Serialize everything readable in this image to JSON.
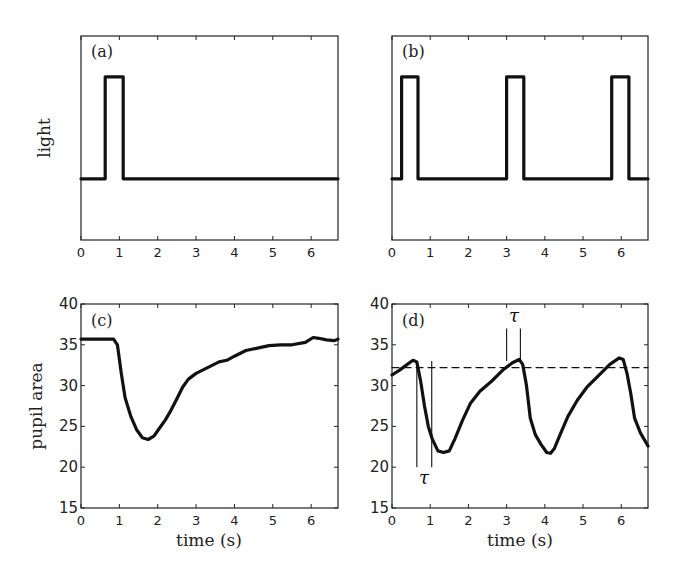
{
  "chart_data": [
    {
      "panel": "(a)",
      "type": "line",
      "title": "",
      "xlabel": "",
      "ylabel": "light",
      "xlim": [
        0,
        6.7
      ],
      "ylim": [
        -0.6,
        1.4
      ],
      "xticks": [
        "0",
        "1",
        "2",
        "3",
        "4",
        "5",
        "6"
      ],
      "yticks": [],
      "grid": false,
      "series": [
        {
          "name": "light stimulus",
          "x": [
            0,
            0.63,
            0.63,
            1.1,
            1.1,
            6.7
          ],
          "y": [
            0,
            0,
            1,
            1,
            0,
            0
          ]
        }
      ]
    },
    {
      "panel": "(b)",
      "type": "line",
      "title": "",
      "xlabel": "",
      "ylabel": "",
      "xlim": [
        0,
        6.7
      ],
      "ylim": [
        -0.6,
        1.4
      ],
      "xticks": [
        "0",
        "1",
        "2",
        "3",
        "4",
        "5",
        "6"
      ],
      "yticks": [],
      "grid": false,
      "series": [
        {
          "name": "light stimulus",
          "x": [
            0,
            0.25,
            0.25,
            0.68,
            0.68,
            3.0,
            3.0,
            3.45,
            3.45,
            5.75,
            5.75,
            6.2,
            6.2,
            6.7
          ],
          "y": [
            0,
            0,
            1,
            1,
            0,
            0,
            1,
            1,
            0,
            0,
            1,
            1,
            0,
            0
          ]
        }
      ]
    },
    {
      "panel": "(c)",
      "type": "line",
      "title": "",
      "xlabel": "time (s)",
      "ylabel": "pupil area",
      "xlim": [
        0,
        6.7
      ],
      "ylim": [
        15,
        40
      ],
      "xticks": [
        "0",
        "1",
        "2",
        "3",
        "4",
        "5",
        "6"
      ],
      "yticks": [
        "15",
        "20",
        "25",
        "30",
        "35",
        "40"
      ],
      "grid": false,
      "series": [
        {
          "name": "pupil area",
          "x": [
            0,
            0.85,
            0.95,
            1.05,
            1.15,
            1.3,
            1.45,
            1.6,
            1.75,
            1.9,
            2.05,
            2.2,
            2.35,
            2.5,
            2.65,
            2.8,
            3.0,
            3.3,
            3.6,
            3.8,
            4.0,
            4.3,
            4.6,
            4.9,
            5.2,
            5.5,
            5.85,
            6.05,
            6.2,
            6.4,
            6.6,
            6.7
          ],
          "y": [
            35.7,
            35.7,
            35.0,
            31.5,
            28.5,
            26.2,
            24.6,
            23.6,
            23.4,
            23.8,
            24.8,
            25.8,
            27.0,
            28.4,
            29.8,
            30.8,
            31.5,
            32.2,
            32.9,
            33.1,
            33.6,
            34.3,
            34.6,
            34.9,
            35.0,
            35.0,
            35.3,
            35.9,
            35.8,
            35.6,
            35.5,
            35.7
          ]
        }
      ]
    },
    {
      "panel": "(d)",
      "type": "line",
      "title": "",
      "xlabel": "time (s)",
      "ylabel": "",
      "xlim": [
        0,
        6.7
      ],
      "ylim": [
        15,
        40
      ],
      "xticks": [
        "0",
        "1",
        "2",
        "3",
        "4",
        "5",
        "6"
      ],
      "yticks": [
        "15",
        "20",
        "25",
        "30",
        "35",
        "40"
      ],
      "grid": false,
      "series": [
        {
          "name": "pupil area",
          "x": [
            0,
            0.2,
            0.4,
            0.55,
            0.65,
            0.75,
            0.85,
            0.95,
            1.05,
            1.2,
            1.35,
            1.5,
            1.65,
            1.85,
            2.05,
            2.3,
            2.6,
            2.9,
            3.15,
            3.33,
            3.42,
            3.52,
            3.62,
            3.75,
            3.9,
            4.05,
            4.15,
            4.25,
            4.4,
            4.6,
            4.85,
            5.1,
            5.4,
            5.7,
            5.95,
            6.05,
            6.15,
            6.25,
            6.35,
            6.5,
            6.7
          ],
          "y": [
            31.3,
            31.9,
            32.6,
            33.1,
            32.9,
            30.5,
            27.5,
            25.0,
            23.5,
            22.0,
            21.8,
            22.0,
            23.5,
            25.8,
            27.8,
            29.3,
            30.5,
            31.9,
            32.8,
            33.2,
            32.6,
            30.0,
            26.0,
            24.0,
            22.8,
            21.8,
            21.7,
            22.3,
            24.0,
            26.2,
            28.2,
            29.8,
            31.2,
            32.6,
            33.4,
            33.2,
            31.5,
            29.0,
            26.0,
            24.2,
            22.6
          ]
        },
        {
          "name": "threshold (dashed)",
          "x": [
            0,
            6.7
          ],
          "y": [
            32.2,
            32.2
          ]
        }
      ],
      "annotations": [
        {
          "text": "τ",
          "position": "below",
          "x_range": [
            0.65,
            1.04
          ],
          "y_range": [
            20,
            33
          ]
        },
        {
          "text": "τ",
          "position": "above",
          "x_range": [
            3.0,
            3.36
          ],
          "y_range": [
            33,
            37
          ]
        }
      ]
    }
  ],
  "labels": {
    "panel_a": "(a)",
    "panel_b": "(b)",
    "panel_c": "(c)",
    "panel_d": "(d)",
    "ylabel_light": "light",
    "ylabel_pupil": "pupil area",
    "xlabel_c": "time (s)",
    "xlabel_d": "time (s)",
    "tau_lower": "τ",
    "tau_upper": "τ"
  }
}
